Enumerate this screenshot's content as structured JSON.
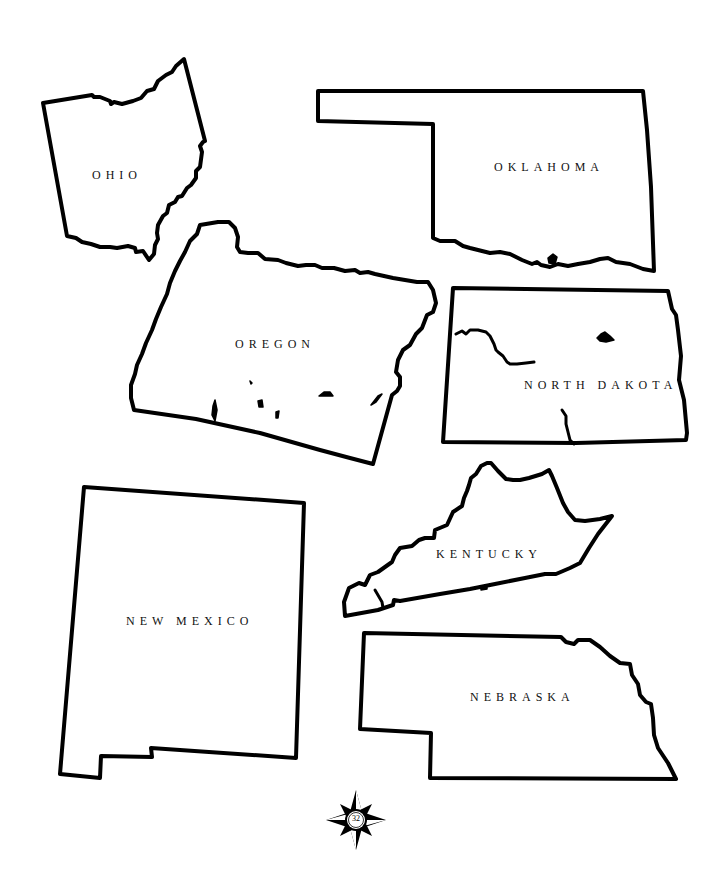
{
  "page": {
    "number": "32",
    "background": "#ffffff",
    "outline_color": "#000000"
  },
  "states": [
    {
      "id": "ohio",
      "label": "OHIO"
    },
    {
      "id": "oklahoma",
      "label": "OKLAHOMA"
    },
    {
      "id": "oregon",
      "label": "OREGON"
    },
    {
      "id": "north-dakota",
      "label": "NORTH DAKOTA"
    },
    {
      "id": "new-mexico",
      "label": "NEW MEXICO"
    },
    {
      "id": "kentucky",
      "label": "KENTUCKY"
    },
    {
      "id": "nebraska",
      "label": "NEBRASKA"
    }
  ],
  "icons": {
    "compass": "compass-rose-icon"
  }
}
